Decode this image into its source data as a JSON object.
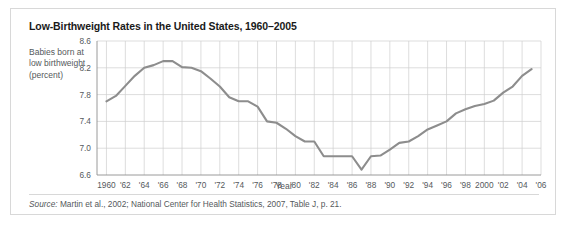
{
  "figure": {
    "title": "Low-Birthweight Rates in the United States, 1960–2005",
    "y_caption": "Babies born at low birthweight (percent)",
    "source_label": "Source:",
    "source_text": " Martin et al., 2002; National Center for Health Statistics, 2007, Table J, p. 21."
  },
  "chart_data": {
    "type": "line",
    "title": "Low-Birthweight Rates in the United States, 1960–2005",
    "xlabel": "Year",
    "ylabel": "Babies born at low birthweight (percent)",
    "xlim": [
      1959,
      2006
    ],
    "ylim": [
      6.6,
      8.6
    ],
    "ytick_values": [
      8.6,
      8.2,
      7.8,
      7.4,
      7.0,
      6.6
    ],
    "ytick_labels": [
      "8.6",
      "8.2",
      "7.8",
      "7.4",
      "7.0",
      "6.6"
    ],
    "xtick_values": [
      1960,
      1962,
      1964,
      1966,
      1968,
      1970,
      1972,
      1974,
      1976,
      1978,
      1980,
      1982,
      1984,
      1986,
      1988,
      1990,
      1992,
      1994,
      1996,
      1998,
      2000,
      2002,
      2004,
      2006
    ],
    "xtick_labels": [
      "1960",
      "'62",
      "'64",
      "'66",
      "'68",
      "'70",
      "'72",
      "'74",
      "'76",
      "'78",
      "'80",
      "'82",
      "'84",
      "'86",
      "'88",
      "'90",
      "'92",
      "'94",
      "'96",
      "'98",
      "2000",
      "'02",
      "'04",
      "'06"
    ],
    "grid": "both",
    "legend": "none",
    "line_color": "#8d8d8d",
    "x": [
      1960,
      1961,
      1962,
      1963,
      1964,
      1965,
      1966,
      1967,
      1968,
      1969,
      1970,
      1971,
      1972,
      1973,
      1974,
      1975,
      1976,
      1977,
      1978,
      1979,
      1980,
      1981,
      1982,
      1983,
      1984,
      1985,
      1986,
      1987,
      1988,
      1989,
      1990,
      1991,
      1992,
      1993,
      1994,
      1995,
      1996,
      1997,
      1998,
      1999,
      2000,
      2001,
      2002,
      2003,
      2004,
      2005
    ],
    "y": [
      7.7,
      7.78,
      7.93,
      8.08,
      8.2,
      8.24,
      8.3,
      8.3,
      8.21,
      8.2,
      8.15,
      8.04,
      7.92,
      7.76,
      7.7,
      7.7,
      7.62,
      7.4,
      7.38,
      7.29,
      7.18,
      7.1,
      7.1,
      6.88,
      6.88,
      6.88,
      6.88,
      6.68,
      6.88,
      6.89,
      6.98,
      7.08,
      7.1,
      7.18,
      7.28,
      7.34,
      7.4,
      7.52,
      7.58,
      7.63,
      7.66,
      7.71,
      7.83,
      7.92,
      8.08,
      8.18
    ]
  }
}
